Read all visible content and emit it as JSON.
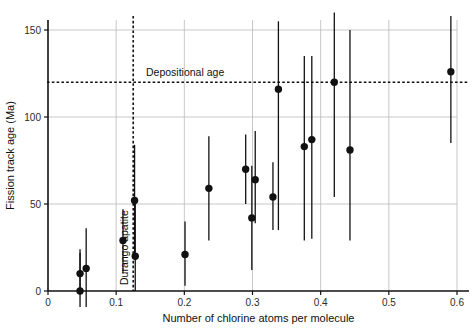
{
  "chart_data": {
    "type": "scatter",
    "title": "",
    "xlabel": "Number of chlorine atoms per molecule",
    "ylabel": "Fission track age (Ma)",
    "xlim": [
      0,
      0.6
    ],
    "ylim": [
      0,
      157
    ],
    "xticks": [
      0,
      0.1,
      0.2,
      0.3,
      0.4,
      0.5,
      0.6
    ],
    "xtick_labels": [
      "0",
      "0.1",
      "0.2",
      "0.3",
      "0.4",
      "0.5",
      "0.6"
    ],
    "yticks": [
      0,
      50,
      100,
      150
    ],
    "ytick_labels": [
      "0",
      "50",
      "100",
      "150"
    ],
    "grid": true,
    "grid_color": "#b9b9b9",
    "legend": "none",
    "marker": "filled-circle",
    "marker_color": "#111111",
    "error_bar_direction": "vertical",
    "points": [
      {
        "x": 0.047,
        "y": 0,
        "y_low": -12,
        "y_high": 22
      },
      {
        "x": 0.047,
        "y": 10,
        "y_low": -2,
        "y_high": 24
      },
      {
        "x": 0.056,
        "y": 13,
        "y_low": -10,
        "y_high": 36
      },
      {
        "x": 0.11,
        "y": 29,
        "y_low": 10,
        "y_high": 47
      },
      {
        "x": 0.127,
        "y": 52,
        "y_low": 19,
        "y_high": 84
      },
      {
        "x": 0.128,
        "y": 20,
        "y_low": 0,
        "y_high": 52
      },
      {
        "x": 0.201,
        "y": 21,
        "y_low": 3,
        "y_high": 40
      },
      {
        "x": 0.236,
        "y": 59,
        "y_low": 29,
        "y_high": 89
      },
      {
        "x": 0.29,
        "y": 70,
        "y_low": 50,
        "y_high": 90
      },
      {
        "x": 0.299,
        "y": 42,
        "y_low": 12,
        "y_high": 72
      },
      {
        "x": 0.304,
        "y": 64,
        "y_low": 39,
        "y_high": 92
      },
      {
        "x": 0.33,
        "y": 54,
        "y_low": 35,
        "y_high": 74
      },
      {
        "x": 0.338,
        "y": 116,
        "y_low": 35,
        "y_high": 155
      },
      {
        "x": 0.376,
        "y": 83,
        "y_low": 29,
        "y_high": 135
      },
      {
        "x": 0.387,
        "y": 87,
        "y_low": 30,
        "y_high": 135
      },
      {
        "x": 0.42,
        "y": 120,
        "y_low": 54,
        "y_high": 160
      },
      {
        "x": 0.443,
        "y": 81,
        "y_low": 29,
        "y_high": 150
      },
      {
        "x": 0.591,
        "y": 126,
        "y_low": 85,
        "y_high": 158
      }
    ],
    "reference_lines": [
      {
        "name": "depositional-age",
        "orientation": "horizontal",
        "value": 120,
        "label": "Depositional age",
        "style": "dashed"
      },
      {
        "name": "durango-apatite",
        "orientation": "vertical",
        "value": 0.125,
        "label": "Durango apatite",
        "style": "dashed"
      }
    ]
  }
}
